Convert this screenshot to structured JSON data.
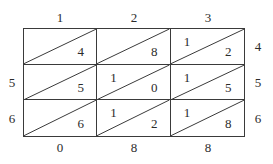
{
  "figure": {
    "name": "lattice-multiplication-grid",
    "rows": 3,
    "columns": 3,
    "line_color": "#3a3a3a",
    "text_color": "#2b2b2b",
    "background_color": "#ffffff"
  },
  "labels": {
    "top": [
      "1",
      "2",
      "3"
    ],
    "bottom": [
      "0",
      "8",
      "8"
    ],
    "left": [
      "",
      "5",
      "6"
    ],
    "right": [
      "4",
      "5",
      "6"
    ]
  },
  "cells": [
    [
      {
        "upper": "",
        "lower": "4"
      },
      {
        "upper": "",
        "lower": "8"
      },
      {
        "upper": "1",
        "lower": "2"
      }
    ],
    [
      {
        "upper": "",
        "lower": "5"
      },
      {
        "upper": "1",
        "lower": "0"
      },
      {
        "upper": "1",
        "lower": "5"
      }
    ],
    [
      {
        "upper": "",
        "lower": "6"
      },
      {
        "upper": "1",
        "lower": "2"
      },
      {
        "upper": "1",
        "lower": "8"
      }
    ]
  ]
}
